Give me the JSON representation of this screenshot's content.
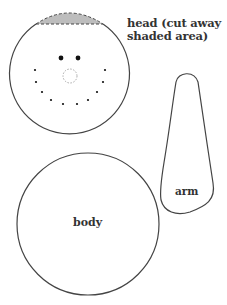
{
  "diagram": {
    "type": "pattern-pieces",
    "pieces": [
      {
        "id": "head",
        "label_line1": "head (cut away",
        "label_line2": "shaded area)",
        "shape": "circle",
        "center": [
          69,
          72
        ],
        "radius": 60,
        "cut_away": {
          "description": "shaded circular cap at top, bounded by dashed line",
          "fill": "#bdbdbd",
          "dashed_line_y": 24
        },
        "face": {
          "eyes": [
            [
              61,
              58
            ],
            [
              78,
              58
            ]
          ],
          "nose": {
            "center": [
              70,
              76
            ],
            "radius": 7,
            "style": "dotted-grey"
          },
          "mouth_dots": [
            [
              35,
              70
            ],
            [
              36,
              82
            ],
            [
              42,
              92
            ],
            [
              51,
              100
            ],
            [
              63,
              104
            ],
            [
              77,
              104
            ],
            [
              88,
              100
            ],
            [
              97,
              92
            ],
            [
              103,
              82
            ],
            [
              105,
              70
            ]
          ]
        }
      },
      {
        "id": "arm",
        "label": "arm",
        "shape": "elongated-teardrop"
      },
      {
        "id": "body",
        "label": "body",
        "shape": "circle",
        "center": [
          88,
          224
        ],
        "radius": 71
      }
    ],
    "colors": {
      "outline": "#444444",
      "shade": "#bdbdbd",
      "dots": "#111111",
      "nose": "#aaaaaa",
      "text": "#333333"
    }
  }
}
